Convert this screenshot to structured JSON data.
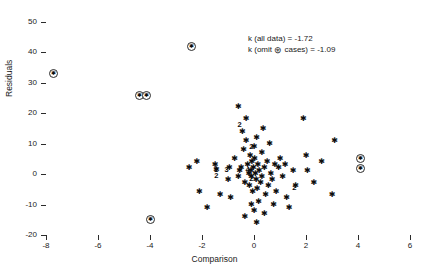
{
  "chart_data": {
    "type": "scatter",
    "title": "",
    "xlabel": "Comparison",
    "ylabel": "Residuals",
    "xlim": [
      -8,
      6
    ],
    "ylim": [
      -20,
      50
    ],
    "xticks": [
      -8,
      -6,
      -4,
      -2,
      0,
      2,
      4,
      6
    ],
    "yticks": [
      -20,
      -10,
      0,
      10,
      20,
      30,
      40,
      50
    ],
    "xtick_labels": [
      "-8",
      "-6",
      "-4",
      "-2",
      "0",
      "2",
      "4",
      "6"
    ],
    "ytick_labels": [
      "-20",
      "-10",
      "0",
      "10",
      "20",
      "30",
      "40",
      "50"
    ],
    "grid": false,
    "legend": null,
    "annotations": [
      "k (all data) = -1.72",
      "k (omit ⊛ cases) = -1.09"
    ],
    "annotation_lines": [
      {
        "prefix": "k (all data) = -1.72",
        "symbol": "",
        "suffix": ""
      },
      {
        "prefix": "k (omit ",
        "symbol": "⊛",
        "suffix": " cases) = -1.09"
      }
    ],
    "marker_legend": {
      "star": "single observation (asterisk)",
      "circled_star": "omitted / flagged case (circled asterisk)",
      "digit": "count of coincident observations at that location"
    },
    "series": [
      {
        "name": "flagged cases (circled asterisk)",
        "marker": "circled-star",
        "points": [
          {
            "x": -7.7,
            "y": 33
          },
          {
            "x": -4.4,
            "y": 26
          },
          {
            "x": -4.15,
            "y": 26
          },
          {
            "x": -2.4,
            "y": 42
          },
          {
            "x": -4.0,
            "y": -15
          },
          {
            "x": 4.1,
            "y": 5
          },
          {
            "x": 4.1,
            "y": 2
          }
        ]
      },
      {
        "name": "observations (asterisk)",
        "marker": "star",
        "points": [
          {
            "x": -1.5,
            "y": 3
          },
          {
            "x": -1.45,
            "y": 1.5
          },
          {
            "x": -1.3,
            "y": -7
          },
          {
            "x": -1.0,
            "y": -2
          },
          {
            "x": -0.95,
            "y": 2
          },
          {
            "x": -0.9,
            "y": -8
          },
          {
            "x": -0.75,
            "y": 5
          },
          {
            "x": -0.6,
            "y": -1
          },
          {
            "x": -0.55,
            "y": 1
          },
          {
            "x": -0.5,
            "y": 2
          },
          {
            "x": -0.45,
            "y": 14
          },
          {
            "x": -0.4,
            "y": 8
          },
          {
            "x": -0.35,
            "y": -3
          },
          {
            "x": -0.3,
            "y": 18
          },
          {
            "x": -0.3,
            "y": 11
          },
          {
            "x": -0.25,
            "y": 3
          },
          {
            "x": -0.2,
            "y": 0
          },
          {
            "x": -0.18,
            "y": -4
          },
          {
            "x": -0.15,
            "y": 6
          },
          {
            "x": -0.12,
            "y": 1
          },
          {
            "x": -0.1,
            "y": -1
          },
          {
            "x": -0.08,
            "y": 4
          },
          {
            "x": -0.05,
            "y": -6
          },
          {
            "x": -0.02,
            "y": 2
          },
          {
            "x": 0.0,
            "y": 9
          },
          {
            "x": 0.0,
            "y": -12
          },
          {
            "x": 0.02,
            "y": 5
          },
          {
            "x": 0.05,
            "y": 0
          },
          {
            "x": 0.08,
            "y": -2
          },
          {
            "x": 0.1,
            "y": 12
          },
          {
            "x": 0.12,
            "y": -5
          },
          {
            "x": 0.15,
            "y": 3
          },
          {
            "x": 0.18,
            "y": -9
          },
          {
            "x": 0.2,
            "y": 1
          },
          {
            "x": 0.25,
            "y": -3
          },
          {
            "x": 0.3,
            "y": 7
          },
          {
            "x": 0.3,
            "y": -1
          },
          {
            "x": 0.35,
            "y": 15
          },
          {
            "x": 0.4,
            "y": 2
          },
          {
            "x": 0.45,
            "y": -7
          },
          {
            "x": 0.5,
            "y": 4
          },
          {
            "x": 0.55,
            "y": -4
          },
          {
            "x": 0.6,
            "y": 10
          },
          {
            "x": 0.65,
            "y": 0
          },
          {
            "x": 0.7,
            "y": -2
          },
          {
            "x": 0.8,
            "y": 3
          },
          {
            "x": 0.85,
            "y": -6
          },
          {
            "x": 0.95,
            "y": 2
          },
          {
            "x": 1.0,
            "y": 5
          },
          {
            "x": 1.1,
            "y": -1
          },
          {
            "x": 1.2,
            "y": 3
          },
          {
            "x": 1.25,
            "y": -8
          },
          {
            "x": 1.5,
            "y": 1
          },
          {
            "x": 1.6,
            "y": -4
          },
          {
            "x": 1.9,
            "y": 18
          },
          {
            "x": 2.0,
            "y": 6
          },
          {
            "x": 2.05,
            "y": 1
          },
          {
            "x": 2.3,
            "y": -3
          },
          {
            "x": 2.6,
            "y": 4
          },
          {
            "x": 3.0,
            "y": -7
          },
          {
            "x": 3.1,
            "y": 11
          },
          {
            "x": -2.2,
            "y": 4
          },
          {
            "x": -2.1,
            "y": -6
          },
          {
            "x": -1.8,
            "y": -11
          },
          {
            "x": -2.5,
            "y": 2
          },
          {
            "x": -0.6,
            "y": 22
          },
          {
            "x": -0.35,
            "y": -14
          },
          {
            "x": 0.4,
            "y": -13
          },
          {
            "x": 0.1,
            "y": -16
          },
          {
            "x": -0.1,
            "y": -10
          },
          {
            "x": 1.35,
            "y": -11
          },
          {
            "x": 0.75,
            "y": -10
          }
        ]
      },
      {
        "name": "coincident-count labels",
        "marker": "digit",
        "points": [
          {
            "x": -0.55,
            "y": 16,
            "label": "2"
          },
          {
            "x": -0.1,
            "y": 9,
            "label": "2"
          },
          {
            "x": -1.45,
            "y": 1.5,
            "label": "2"
          },
          {
            "x": -1.45,
            "y": -0.5,
            "label": "2"
          },
          {
            "x": -1.05,
            "y": 1.5,
            "label": "3"
          },
          {
            "x": -0.25,
            "y": 1.5,
            "label": "4"
          },
          {
            "x": -0.1,
            "y": -1.5,
            "label": "2"
          },
          {
            "x": 1.55,
            "y": -4.5,
            "label": "2"
          }
        ]
      }
    ]
  }
}
